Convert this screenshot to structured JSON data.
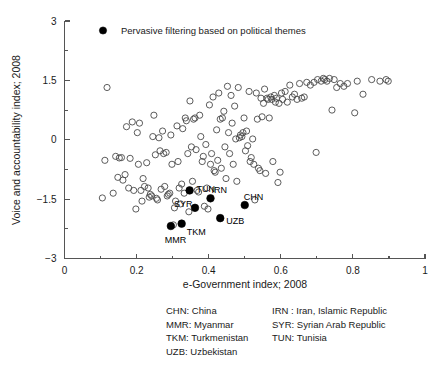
{
  "chart_data": {
    "type": "scatter",
    "title": "",
    "xlabel": "e-Government index; 2008",
    "ylabel": "Voice and accountability index; 2008",
    "xlim": [
      0,
      1
    ],
    "ylim": [
      -3,
      3
    ],
    "xticks": [
      "0",
      "0.2",
      "0.4",
      "0.6",
      "0.8",
      "1"
    ],
    "xtick_values": [
      0,
      0.2,
      0.4,
      0.6,
      0.8,
      1
    ],
    "xminor_values": [
      0.1,
      0.3,
      0.5,
      0.7,
      0.9
    ],
    "yticks": [
      "3",
      "1.5",
      "0",
      "-1.5",
      "-3"
    ],
    "ytick_values": [
      3,
      1.5,
      0,
      -1.5,
      -3
    ],
    "yminor_values": [
      2.25,
      0.75,
      -0.75,
      -2.25
    ],
    "grid": false,
    "legend_position": "top-left",
    "series": [
      {
        "name": "Other countries",
        "marker": "open-circle",
        "color": "#4a4a4a",
        "points": [
          [
            0.105,
            -1.47
          ],
          [
            0.112,
            -0.52
          ],
          [
            0.118,
            1.32
          ],
          [
            0.135,
            -1.35
          ],
          [
            0.142,
            -0.42
          ],
          [
            0.148,
            -0.95
          ],
          [
            0.152,
            -0.46
          ],
          [
            0.158,
            -0.45
          ],
          [
            0.162,
            -1.02
          ],
          [
            0.168,
            -0.88
          ],
          [
            0.172,
            0.33
          ],
          [
            0.178,
            -1.22
          ],
          [
            0.182,
            -0.47
          ],
          [
            0.188,
            0.45
          ],
          [
            0.192,
            -1.28
          ],
          [
            0.198,
            -1.75
          ],
          [
            0.202,
            0.18
          ],
          [
            0.205,
            -0.62
          ],
          [
            0.208,
            0.42
          ],
          [
            0.212,
            -1.28
          ],
          [
            0.215,
            -1.55
          ],
          [
            0.218,
            -0.98
          ],
          [
            0.222,
            -1.18
          ],
          [
            0.228,
            -0.58
          ],
          [
            0.232,
            -1.22
          ],
          [
            0.235,
            -1.45
          ],
          [
            0.238,
            -1.38
          ],
          [
            0.242,
            -1.42
          ],
          [
            0.245,
            0.08
          ],
          [
            0.248,
            0.62
          ],
          [
            0.252,
            -0.38
          ],
          [
            0.255,
            -1.48
          ],
          [
            0.258,
            -1.52
          ],
          [
            0.262,
            0.05
          ],
          [
            0.265,
            -0.28
          ],
          [
            0.268,
            -1.25
          ],
          [
            0.272,
            0.22
          ],
          [
            0.275,
            -0.35
          ],
          [
            0.278,
            -1.18
          ],
          [
            0.282,
            -0.32
          ],
          [
            0.285,
            -1.42
          ],
          [
            0.288,
            -1.38
          ],
          [
            0.292,
            -1.35
          ],
          [
            0.295,
            0.12
          ],
          [
            0.298,
            -0.62
          ],
          [
            0.302,
            -2.15
          ],
          [
            0.305,
            -1.72
          ],
          [
            0.308,
            -1.55
          ],
          [
            0.312,
            0.35
          ],
          [
            0.315,
            -0.55
          ],
          [
            0.318,
            -1.22
          ],
          [
            0.322,
            -1.62
          ],
          [
            0.325,
            -1.12
          ],
          [
            0.328,
            0.28
          ],
          [
            0.332,
            -1.35
          ],
          [
            0.335,
            0.55
          ],
          [
            0.338,
            0.48
          ],
          [
            0.342,
            -0.35
          ],
          [
            0.345,
            -1.82
          ],
          [
            0.348,
            0.98
          ],
          [
            0.352,
            -0.18
          ],
          [
            0.355,
            -1.05
          ],
          [
            0.358,
            0.52
          ],
          [
            0.362,
            0.55
          ],
          [
            0.365,
            -0.25
          ],
          [
            0.368,
            -1.28
          ],
          [
            0.372,
            -1.32
          ],
          [
            0.375,
            0.62
          ],
          [
            0.378,
            0.08
          ],
          [
            0.382,
            -0.55
          ],
          [
            0.385,
            -0.42
          ],
          [
            0.388,
            -1.68
          ],
          [
            0.392,
            -0.12
          ],
          [
            0.395,
            -1.22
          ],
          [
            0.398,
            -1.75
          ],
          [
            0.402,
            0.88
          ],
          [
            0.405,
            -0.62
          ],
          [
            0.408,
            -0.35
          ],
          [
            0.412,
            1.08
          ],
          [
            0.415,
            -0.78
          ],
          [
            0.418,
            -0.82
          ],
          [
            0.422,
            0.25
          ],
          [
            0.425,
            -0.52
          ],
          [
            0.428,
            1.18
          ],
          [
            0.432,
            0.52
          ],
          [
            0.435,
            -0.72
          ],
          [
            0.438,
            0.55
          ],
          [
            0.442,
            0.72
          ],
          [
            0.445,
            -0.18
          ],
          [
            0.448,
            -0.98
          ],
          [
            0.452,
            1.35
          ],
          [
            0.455,
            0.18
          ],
          [
            0.458,
            -0.35
          ],
          [
            0.462,
            1.12
          ],
          [
            0.465,
            0.42
          ],
          [
            0.468,
            -0.62
          ],
          [
            0.472,
            0.85
          ],
          [
            0.475,
            0.02
          ],
          [
            0.478,
            -1.05
          ],
          [
            0.482,
            1.32
          ],
          [
            0.485,
            0.05
          ],
          [
            0.488,
            0.12
          ],
          [
            0.492,
            0.08
          ],
          [
            0.495,
            0.18
          ],
          [
            0.498,
            0.55
          ],
          [
            0.502,
            -0.28
          ],
          [
            0.505,
            0.22
          ],
          [
            0.508,
            -0.15
          ],
          [
            0.512,
            1.22
          ],
          [
            0.515,
            -0.55
          ],
          [
            0.518,
            -0.45
          ],
          [
            0.522,
            0.02
          ],
          [
            0.525,
            -0.62
          ],
          [
            0.528,
            -1.52
          ],
          [
            0.532,
            1.18
          ],
          [
            0.535,
            0.52
          ],
          [
            0.538,
            -0.72
          ],
          [
            0.542,
            -0.78
          ],
          [
            0.545,
            1.05
          ],
          [
            0.548,
            0.58
          ],
          [
            0.552,
            0.92
          ],
          [
            0.555,
            1.28
          ],
          [
            0.558,
            -0.85
          ],
          [
            0.562,
            1.05
          ],
          [
            0.565,
            1.02
          ],
          [
            0.568,
            0.55
          ],
          [
            0.572,
            1.08
          ],
          [
            0.575,
            1.02
          ],
          [
            0.578,
            -0.55
          ],
          [
            0.582,
            1.12
          ],
          [
            0.585,
            0.95
          ],
          [
            0.588,
            1.05
          ],
          [
            0.592,
            -1.08
          ],
          [
            0.595,
            0.92
          ],
          [
            0.598,
            -0.82
          ],
          [
            0.602,
            1.18
          ],
          [
            0.605,
            1.02
          ],
          [
            0.612,
            1.22
          ],
          [
            0.618,
            0.95
          ],
          [
            0.625,
            1.38
          ],
          [
            0.632,
            1.08
          ],
          [
            0.638,
            1.15
          ],
          [
            0.645,
            1.02
          ],
          [
            0.652,
            1.42
          ],
          [
            0.658,
            1.05
          ],
          [
            0.665,
            1.08
          ],
          [
            0.672,
            1.45
          ],
          [
            0.682,
            1.38
          ],
          [
            0.692,
            1.45
          ],
          [
            0.698,
            -0.32
          ],
          [
            0.702,
            1.52
          ],
          [
            0.712,
            1.48
          ],
          [
            0.718,
            1.55
          ],
          [
            0.722,
            1.52
          ],
          [
            0.728,
            1.48
          ],
          [
            0.735,
            1.55
          ],
          [
            0.742,
            0.75
          ],
          [
            0.748,
            1.52
          ],
          [
            0.755,
            1.32
          ],
          [
            0.765,
            1.42
          ],
          [
            0.775,
            1.35
          ],
          [
            0.785,
            1.42
          ],
          [
            0.805,
            0.68
          ],
          [
            0.812,
            1.48
          ],
          [
            0.828,
            1.15
          ],
          [
            0.852,
            1.52
          ],
          [
            0.875,
            1.48
          ],
          [
            0.892,
            1.52
          ],
          [
            0.898,
            1.48
          ]
        ]
      },
      {
        "name": "Pervasive filtering based on political themes",
        "marker": "filled-circle",
        "color": "#000000",
        "points": [
          {
            "code": "TUN",
            "x": 0.347,
            "y": -1.28
          },
          {
            "code": "IRN",
            "x": 0.405,
            "y": -1.48
          },
          {
            "code": "CHN",
            "x": 0.5,
            "y": -1.65
          },
          {
            "code": "SYR",
            "x": 0.362,
            "y": -1.72
          },
          {
            "code": "UZB",
            "x": 0.432,
            "y": -1.98
          },
          {
            "code": "TKM",
            "x": 0.325,
            "y": -2.12
          },
          {
            "code": "MMR",
            "x": 0.295,
            "y": -2.18
          }
        ]
      }
    ],
    "annotations": [
      {
        "text": "TUN",
        "x": 0.347,
        "y": -1.28,
        "dx": 7,
        "dy": -1
      },
      {
        "text": "IRN",
        "x": 0.405,
        "y": -1.48,
        "dx": 1,
        "dy": -8
      },
      {
        "text": "CHN",
        "x": 0.5,
        "y": -1.65,
        "dx": -1,
        "dy": -8
      },
      {
        "text": "SYR",
        "x": 0.362,
        "y": -1.72,
        "dx": -21,
        "dy": -4
      },
      {
        "text": "UZB",
        "x": 0.432,
        "y": -1.98,
        "dx": 6,
        "dy": 3
      },
      {
        "text": "TKM",
        "x": 0.325,
        "y": -2.12,
        "dx": 5,
        "dy": 8
      },
      {
        "text": "MMR",
        "x": 0.295,
        "y": -2.18,
        "dx": -6,
        "dy": 14
      }
    ],
    "legend": [
      {
        "label": "Pervasive filtering based on political themes",
        "marker": "filled-circle",
        "color": "#000000"
      }
    ]
  },
  "axes": {
    "x_title": "e-Government index; 2008",
    "y_title": "Voice and accountability index; 2008",
    "x_tick_labels": [
      "0",
      "0.2",
      "0.4",
      "0.6",
      "0.8",
      "1"
    ],
    "y_tick_labels": [
      "3",
      "1.5",
      "0",
      "−1.5",
      "−3"
    ]
  },
  "legend": {
    "entry_label": "Pervasive filtering based on political themes"
  },
  "country_notes": {
    "column_left": [
      "CHN: China",
      "MMR: Myanmar",
      "TKM: Turkmenistan",
      "UZB: Uzbekistan"
    ],
    "column_right": [
      "IRN : Iran, Islamic Republic",
      "SYR: Syrian Arab Republic",
      "TUN: Tunisia"
    ]
  },
  "colors": {
    "open_marker_stroke": "#4a4a4a",
    "filled_marker": "#000000",
    "axis": "#555555",
    "text": "#1a1a1a",
    "background": "#ffffff"
  }
}
